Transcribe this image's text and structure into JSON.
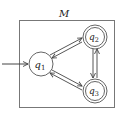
{
  "diagram": {
    "type": "finite-state-machine",
    "machine_label": "M",
    "colors": {
      "stroke": "#555555",
      "box": "#777777",
      "text": "#222222"
    },
    "states": [
      {
        "id": "q1",
        "name": "q",
        "sub": "1",
        "start": true,
        "accepting": false
      },
      {
        "id": "q2",
        "name": "q",
        "sub": "2",
        "start": false,
        "accepting": true
      },
      {
        "id": "q3",
        "name": "q",
        "sub": "3",
        "start": false,
        "accepting": true
      }
    ],
    "transitions": [
      {
        "from": "q1",
        "to": "q2"
      },
      {
        "from": "q2",
        "to": "q1"
      },
      {
        "from": "q1",
        "to": "q3"
      },
      {
        "from": "q3",
        "to": "q1"
      },
      {
        "from": "q2",
        "to": "q3"
      },
      {
        "from": "q3",
        "to": "q2"
      }
    ]
  }
}
